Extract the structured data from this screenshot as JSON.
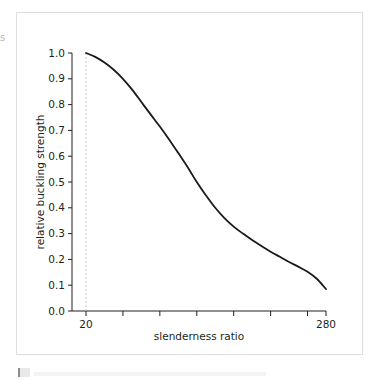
{
  "figure": {
    "background_color": "#ffffff",
    "frame_color": "#dededc",
    "edge_fragment_text": "s"
  },
  "chart_data": {
    "type": "line",
    "title": "",
    "subtitle": "",
    "xlabel": "slenderness ratio",
    "ylabel": "relative buckling strength",
    "xlim": [
      20,
      280
    ],
    "ylim": [
      0.0,
      1.0
    ],
    "grid": false,
    "legend": null,
    "line_color": "#1a1a1a",
    "line_width": 1.8,
    "x_tick_labels": [
      "20",
      "280"
    ],
    "x_tick_values": [
      20,
      280
    ],
    "x_minor_tick_values": [
      60,
      100,
      140,
      180,
      220,
      260
    ],
    "y_tick_labels": [
      "0.0",
      "0.1",
      "0.2",
      "0.3",
      "0.4",
      "0.5",
      "0.6",
      "0.7",
      "0.8",
      "0.9",
      "1.0"
    ],
    "y_tick_values": [
      0.0,
      0.1,
      0.2,
      0.3,
      0.4,
      0.5,
      0.6,
      0.7,
      0.8,
      0.9,
      1.0
    ],
    "annotations": [
      {
        "name": "reference-line-at-20",
        "type": "vertical-dashed-line",
        "x": 20,
        "y_from": 0.0,
        "y_to": 1.0,
        "color": "#c4c4c4"
      }
    ],
    "x": [
      20,
      30,
      40,
      50,
      60,
      70,
      80,
      90,
      100,
      110,
      120,
      130,
      140,
      150,
      160,
      170,
      180,
      190,
      200,
      210,
      220,
      230,
      240,
      250,
      260,
      270,
      280
    ],
    "values": [
      1.0,
      0.985,
      0.963,
      0.935,
      0.9,
      0.858,
      0.81,
      0.762,
      0.715,
      0.665,
      0.612,
      0.558,
      0.5,
      0.448,
      0.4,
      0.36,
      0.327,
      0.3,
      0.275,
      0.252,
      0.23,
      0.21,
      0.19,
      0.172,
      0.152,
      0.125,
      0.085
    ],
    "series": [
      {
        "name": "relative buckling strength",
        "values": [
          1.0,
          0.985,
          0.963,
          0.935,
          0.9,
          0.858,
          0.81,
          0.762,
          0.715,
          0.665,
          0.612,
          0.558,
          0.5,
          0.448,
          0.4,
          0.36,
          0.327,
          0.3,
          0.275,
          0.252,
          0.23,
          0.21,
          0.19,
          0.172,
          0.152,
          0.125,
          0.085
        ]
      }
    ]
  }
}
